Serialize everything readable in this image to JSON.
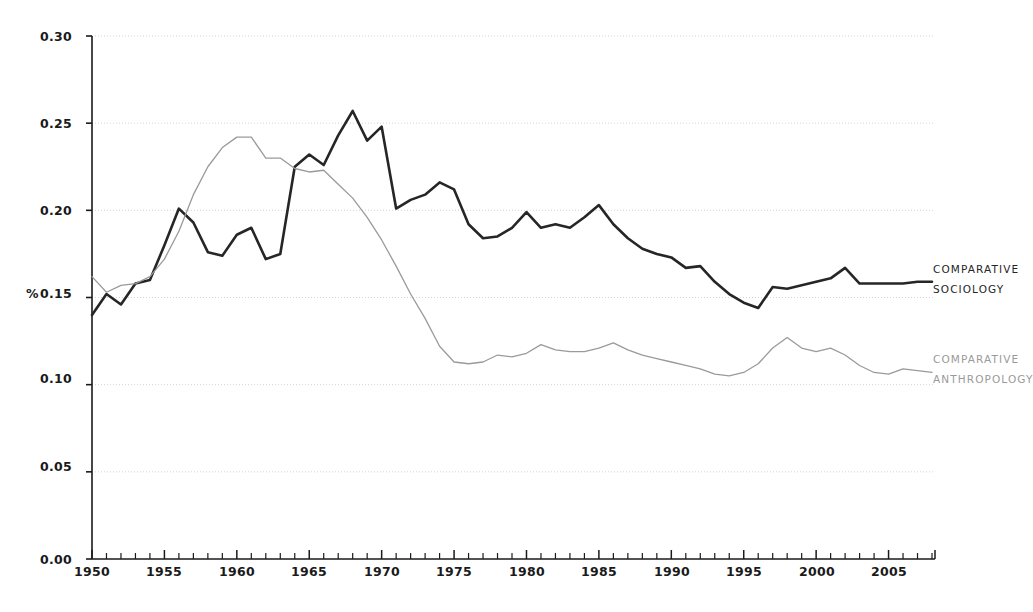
{
  "chart_data": {
    "type": "line",
    "title": "",
    "subtitle": "",
    "xlabel": "",
    "ylabel": "%",
    "xlim": [
      1950,
      2008
    ],
    "ylim": [
      0.0,
      0.3
    ],
    "grid": true,
    "grid_axis": "y",
    "legend_position": "right-inline",
    "y_ticks": [
      "0.00",
      "0.05",
      "0.10",
      "0.15",
      "0.20",
      "0.25",
      "0.30"
    ],
    "y_tick_values": [
      0.0,
      0.05,
      0.1,
      0.15,
      0.2,
      0.25,
      0.3
    ],
    "x_ticks": [
      "1950",
      "1955",
      "1960",
      "1965",
      "1970",
      "1975",
      "1980",
      "1985",
      "1990",
      "1995",
      "2000",
      "2005"
    ],
    "x_tick_values": [
      1950,
      1955,
      1960,
      1965,
      1970,
      1975,
      1980,
      1985,
      1990,
      1995,
      2000,
      2005
    ],
    "x_minor_tick_step": 1,
    "x": [
      1950,
      1951,
      1952,
      1953,
      1954,
      1955,
      1956,
      1957,
      1958,
      1959,
      1960,
      1961,
      1962,
      1963,
      1964,
      1965,
      1966,
      1967,
      1968,
      1969,
      1970,
      1971,
      1972,
      1973,
      1974,
      1975,
      1976,
      1977,
      1978,
      1979,
      1980,
      1981,
      1982,
      1983,
      1984,
      1985,
      1986,
      1987,
      1988,
      1989,
      1990,
      1991,
      1992,
      1993,
      1994,
      1995,
      1996,
      1997,
      1998,
      1999,
      2000,
      2001,
      2002,
      2003,
      2004,
      2005,
      2006,
      2007,
      2008
    ],
    "series": [
      {
        "name": "COMPARATIVE SOCIOLOGY",
        "color": "#262626",
        "linewidth": 2.6,
        "label_lines": [
          "COMPARATIVE",
          "SOCIOLOGY"
        ],
        "values": [
          0.14,
          0.152,
          0.146,
          0.158,
          0.16,
          0.18,
          0.201,
          0.193,
          0.176,
          0.174,
          0.186,
          0.19,
          0.172,
          0.175,
          0.225,
          0.232,
          0.226,
          0.243,
          0.257,
          0.24,
          0.248,
          0.201,
          0.206,
          0.209,
          0.216,
          0.212,
          0.192,
          0.184,
          0.185,
          0.19,
          0.199,
          0.19,
          0.192,
          0.19,
          0.196,
          0.203,
          0.192,
          0.184,
          0.178,
          0.175,
          0.173,
          0.167,
          0.168,
          0.159,
          0.152,
          0.147,
          0.144,
          0.156,
          0.155,
          0.157,
          0.159,
          0.161,
          0.167,
          0.158,
          0.158,
          0.158,
          0.158,
          0.159,
          0.159
        ]
      },
      {
        "name": "COMPARATIVE ANTHROPOLOGY",
        "color": "#9a9a9a",
        "linewidth": 1.3,
        "label_lines": [
          "COMPARATIVE",
          "ANTHROPOLOGY"
        ],
        "values": [
          0.162,
          0.153,
          0.157,
          0.158,
          0.162,
          0.172,
          0.188,
          0.209,
          0.225,
          0.236,
          0.242,
          0.242,
          0.23,
          0.23,
          0.224,
          0.222,
          0.223,
          0.215,
          0.207,
          0.196,
          0.183,
          0.168,
          0.152,
          0.138,
          0.122,
          0.113,
          0.112,
          0.113,
          0.117,
          0.116,
          0.118,
          0.123,
          0.12,
          0.119,
          0.119,
          0.121,
          0.124,
          0.12,
          0.117,
          0.115,
          0.113,
          0.111,
          0.109,
          0.106,
          0.105,
          0.107,
          0.112,
          0.121,
          0.127,
          0.121,
          0.119,
          0.121,
          0.117,
          0.111,
          0.107,
          0.106,
          0.109,
          0.108,
          0.107
        ]
      }
    ]
  },
  "axes": {
    "y_unit_label": "%"
  }
}
